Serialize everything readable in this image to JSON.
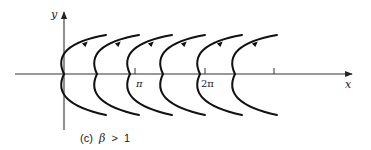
{
  "figure": {
    "type": "phase-portrait",
    "axes": {
      "x_label": "x",
      "y_label": "y",
      "tick_labels": [
        "π",
        "2π",
        ""
      ]
    },
    "curves": {
      "count": 6,
      "shape": "leftward-opening parabolas (vertex on x-axis)",
      "direction": "arrows point up-right along upper branch"
    },
    "caption": {
      "prefix": "(c)",
      "symbol": "β",
      "relation": ">",
      "value": "1"
    }
  }
}
